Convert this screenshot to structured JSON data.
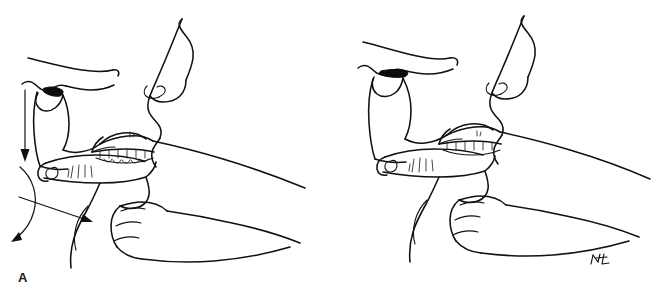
{
  "figure": {
    "background_color": "#ffffff",
    "ink_color": "#111111",
    "width": 656,
    "height": 308,
    "caption": ""
  },
  "panels": [
    {
      "id": "A",
      "label": "A",
      "description": "Sagittal head profile with operator's hand performing jaw thrust; motion arrows indicate downward, forward and rotational displacement of the mandible.",
      "has_arrows": true,
      "arrows": [
        {
          "name": "downward-arrow",
          "meaning": "inferior displacement",
          "direction": "down"
        },
        {
          "name": "curved-rotation-arrow",
          "meaning": "mandibular rotation",
          "direction": "arc-down-left"
        },
        {
          "name": "forward-arrow",
          "meaning": "anterior traction",
          "direction": "down-right"
        }
      ]
    },
    {
      "id": "B",
      "label": "B",
      "description": "Sagittal head profile after the maneuver, showing the repositioned mandible and patent airway.",
      "has_arrows": false,
      "arrows": []
    }
  ],
  "signature": {
    "name": "artist-signature",
    "text": "NL",
    "panel": "B"
  }
}
